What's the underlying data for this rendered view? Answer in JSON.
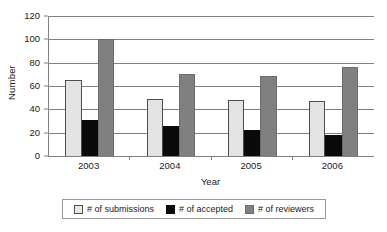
{
  "chart_data": {
    "type": "bar",
    "title": "",
    "xlabel": "Year",
    "ylabel": "Number",
    "categories": [
      "2003",
      "2004",
      "2005",
      "2006"
    ],
    "series": [
      {
        "name": "# of submissions",
        "color": "#e3e3e3",
        "values": [
          65,
          49,
          48,
          47
        ]
      },
      {
        "name": "# of accepted",
        "color": "#0a0a0a",
        "values": [
          31,
          26,
          22,
          18
        ]
      },
      {
        "name": "# of reviewers",
        "color": "#808080",
        "values": [
          100,
          70,
          69,
          76
        ]
      }
    ],
    "ylim": [
      0,
      120
    ],
    "yticks": [
      0,
      20,
      40,
      60,
      80,
      100,
      120
    ],
    "grid": "horizontal",
    "legend_position": "bottom"
  },
  "legend": {
    "items": [
      {
        "label": "# of submissions",
        "swatch": "s-submissions"
      },
      {
        "label": "# of accepted",
        "swatch": "s-accepted"
      },
      {
        "label": "# of reviewers",
        "swatch": "s-reviewers"
      }
    ]
  },
  "colors": {
    "submissions": "#e3e3e3",
    "accepted": "#0a0a0a",
    "reviewers": "#808080",
    "axis": "#808080",
    "grid": "#808080",
    "background": "#ffffff"
  }
}
